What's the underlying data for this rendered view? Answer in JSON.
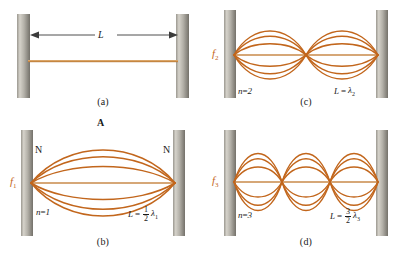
{
  "figure": {
    "colors": {
      "wave": "#C2661C",
      "wave_light": "#D98B3F",
      "string": "#D9A066",
      "post_dark": "#7d7a72",
      "post_light": "#cfccc4",
      "text": "#1a1a1a",
      "frequency_label": "#c4651a",
      "arrow": "#333333"
    },
    "panels": [
      {
        "id": "a",
        "caption": "(a)",
        "length_label": "L",
        "mode": null,
        "description": "String at rest with length L marked by a double-headed arrow"
      },
      {
        "id": "b",
        "caption": "(b)",
        "frequency": "f",
        "frequency_sub": "1",
        "mode_label": "n",
        "mode_value": "1",
        "node_labels": [
          "N",
          "N"
        ],
        "antinode_label": "A",
        "relation_L": "L",
        "relation_num": "1",
        "relation_den": "2",
        "relation_lambda": "λ",
        "relation_lambda_sub": "1",
        "loops": 1
      },
      {
        "id": "c",
        "caption": "(c)",
        "frequency": "f",
        "frequency_sub": "2",
        "mode_label": "n",
        "mode_value": "2",
        "relation_L": "L",
        "relation_lambda": "λ",
        "relation_lambda_sub": "2",
        "loops": 2
      },
      {
        "id": "d",
        "caption": "(d)",
        "frequency": "f",
        "frequency_sub": "3",
        "mode_label": "n",
        "mode_value": "3",
        "relation_num": "3",
        "relation_den": "2",
        "relation_L": "L",
        "relation_lambda": "λ",
        "relation_lambda_sub": "3",
        "loops": 3
      }
    ],
    "equals_sign": "=",
    "mode_symbol_a": "n",
    "mode_symbol_b": "n",
    "mode_symbol_c": "n"
  }
}
